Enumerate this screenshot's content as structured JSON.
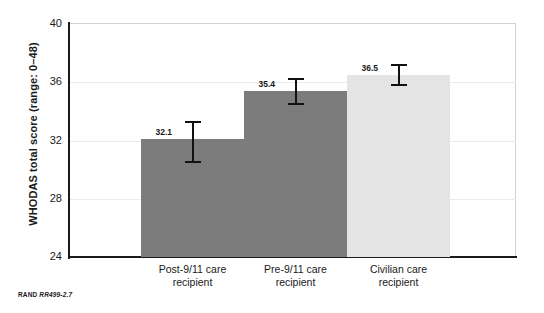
{
  "figure": {
    "note_prefix": "RAND",
    "note_id": "RR499-2.7"
  },
  "chart_data": {
    "type": "bar",
    "title": "",
    "xlabel": "",
    "ylabel": "WHODAS total score (range: 0–48)",
    "ylim": [
      24,
      40
    ],
    "yticks": [
      24,
      28,
      32,
      36,
      40
    ],
    "ytick_labels": [
      "24",
      "28",
      "32",
      "36",
      "40"
    ],
    "grid": true,
    "legend": "none",
    "categories": [
      "Post-9/11 care recipient",
      "Pre-9/11 care recipient",
      "Civilian care recipient"
    ],
    "category_lines": [
      [
        "Post-9/11 care",
        "recipient"
      ],
      [
        "Pre-9/11 care",
        "recipient"
      ],
      [
        "Civilian care",
        "recipient"
      ]
    ],
    "values": [
      32.1,
      35.4,
      36.5
    ],
    "value_labels": [
      "32.1",
      "35.4",
      "36.5"
    ],
    "error_low": [
      30.5,
      34.5,
      35.8
    ],
    "error_high": [
      33.3,
      36.2,
      37.2
    ],
    "bar_colors": [
      "#7c7c7c",
      "#7c7c7c",
      "#e4e4e4"
    ],
    "error_color": "#111111"
  }
}
